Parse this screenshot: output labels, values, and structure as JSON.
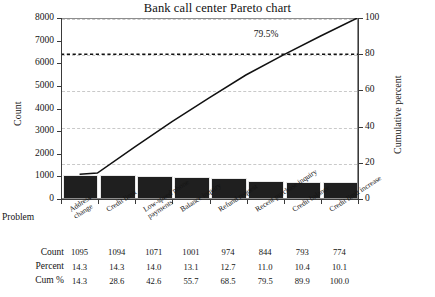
{
  "chart_data": {
    "type": "bar",
    "title": "Bank call center Pareto chart",
    "xlabel": "Problem",
    "ylabel": "Count",
    "y2label": "Cumulative percent",
    "ylim": [
      0,
      8000
    ],
    "y2lim": [
      0,
      100
    ],
    "yticks": [
      "8000",
      "7000",
      "6000",
      "5000",
      "4000",
      "3000",
      "2000",
      "1000",
      "0"
    ],
    "y2ticks": [
      "100",
      "80",
      "60",
      "40",
      "20",
      "0"
    ],
    "grid": true,
    "legend": "none",
    "categories": [
      "Address change",
      "Credit limit",
      "Low-speed phone payments",
      "Balance inquiry",
      "Refund request",
      "Recent purchase inquiry",
      "Credit balance",
      "Credit limit increase"
    ],
    "values": [
      1095,
      1094,
      1071,
      1001,
      974,
      844,
      793,
      774
    ],
    "percent": [
      14.3,
      14.3,
      14.0,
      13.1,
      12.7,
      11.0,
      10.4,
      10.1
    ],
    "cumulative": [
      14.3,
      28.6,
      42.6,
      55.7,
      68.5,
      79.5,
      89.9,
      100.0
    ],
    "annotations": [
      {
        "text": "79.5%",
        "at_category_index": 5
      }
    ],
    "reference_line": {
      "value": 80,
      "axis": "cumulative percent",
      "style": "dashed"
    },
    "total_count": 7646
  },
  "table": {
    "row_labels": [
      "Count",
      "Percent",
      "Cum %"
    ],
    "rows": [
      [
        "1095",
        "1094",
        "1071",
        "1001",
        "974",
        "844",
        "793",
        "774"
      ],
      [
        "14.3",
        "14.3",
        "14.0",
        "13.1",
        "12.7",
        "11.0",
        "10.4",
        "10.1"
      ],
      [
        "14.3",
        "28.6",
        "42.6",
        "55.7",
        "68.5",
        "79.5",
        "89.9",
        "100.0"
      ]
    ]
  },
  "colors": {
    "bar": "#1f1f1f",
    "line": "#111111",
    "grid": "#c9c9c9",
    "frame": "#8d8d8d",
    "text": "#141414"
  }
}
